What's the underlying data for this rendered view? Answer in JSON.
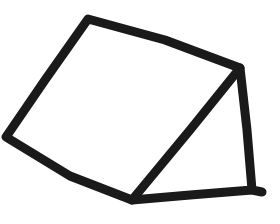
{
  "drawing": {
    "description": "Hand-drawn sketch: a quadrilateral with an attached triangle on its right side",
    "background": "#ffffff",
    "stroke_color": "#1a1a1a",
    "stroke_width": 9,
    "quadrilateral": [
      [
        88,
        19
      ],
      [
        240,
        68
      ],
      [
        132,
        200
      ],
      [
        6,
        137
      ]
    ],
    "triangle": [
      [
        240,
        68
      ],
      [
        254,
        190
      ],
      [
        132,
        200
      ]
    ],
    "bottom_tail": [
      [
        254,
        190
      ],
      [
        262,
        192
      ]
    ]
  }
}
